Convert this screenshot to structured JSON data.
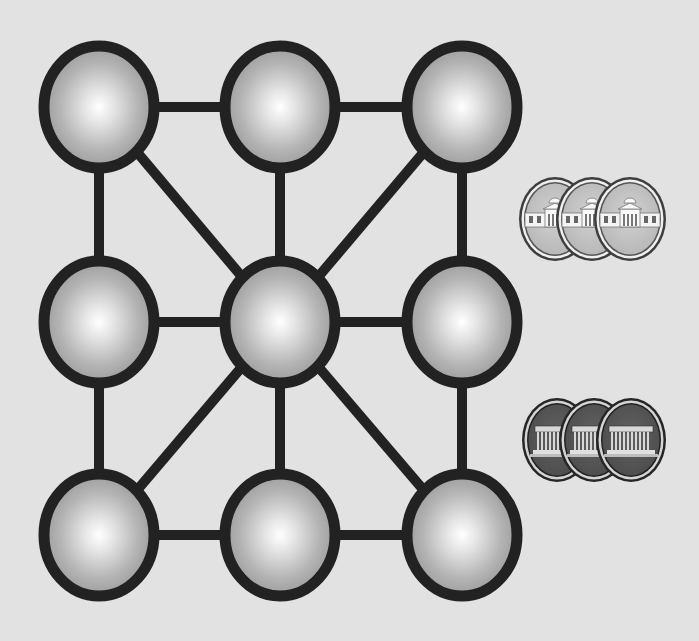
{
  "colors": {
    "background": "#e2e2e2",
    "edge": "#222222",
    "node_center": "#ffffff",
    "node_outer": "#9a9a9a",
    "silver_face": "#c8c8c8",
    "silver_rim": "#4a4a4a",
    "dark_face": "#5a5a5a",
    "dark_rim": "#2e2e2e"
  },
  "board": {
    "node_rx": 60,
    "node_ry": 66,
    "nodes": [
      {
        "id": "top-left",
        "cx": 99,
        "cy": 107
      },
      {
        "id": "top-center",
        "cx": 280,
        "cy": 107
      },
      {
        "id": "top-right",
        "cx": 462,
        "cy": 107
      },
      {
        "id": "middle-left",
        "cx": 99,
        "cy": 322
      },
      {
        "id": "center",
        "cx": 280,
        "cy": 322
      },
      {
        "id": "middle-right",
        "cx": 462,
        "cy": 322
      },
      {
        "id": "bottom-left",
        "cx": 99,
        "cy": 535
      },
      {
        "id": "bottom-center",
        "cx": 280,
        "cy": 535
      },
      {
        "id": "bottom-right",
        "cx": 462,
        "cy": 535
      }
    ],
    "edges": [
      [
        "top-left",
        "top-center"
      ],
      [
        "top-center",
        "top-right"
      ],
      [
        "middle-left",
        "center"
      ],
      [
        "center",
        "middle-right"
      ],
      [
        "bottom-left",
        "bottom-center"
      ],
      [
        "bottom-center",
        "bottom-right"
      ],
      [
        "top-left",
        "middle-left"
      ],
      [
        "middle-left",
        "bottom-left"
      ],
      [
        "top-center",
        "center"
      ],
      [
        "center",
        "bottom-center"
      ],
      [
        "top-right",
        "middle-right"
      ],
      [
        "middle-right",
        "bottom-right"
      ],
      [
        "top-left",
        "center"
      ],
      [
        "top-right",
        "center"
      ],
      [
        "center",
        "bottom-left"
      ],
      [
        "center",
        "bottom-right"
      ]
    ]
  },
  "pieces": {
    "silver_stack": {
      "type": "silver-coin",
      "emblem": "domed-building-icon",
      "count": 3,
      "coins": [
        {
          "cx": 555,
          "cy": 219
        },
        {
          "cx": 592,
          "cy": 219
        },
        {
          "cx": 630,
          "cy": 219
        }
      ],
      "rx": 36,
      "ry": 42
    },
    "dark_stack": {
      "type": "dark-coin",
      "emblem": "memorial-building-icon",
      "count": 3,
      "coins": [
        {
          "cx": 557,
          "cy": 440
        },
        {
          "cx": 594,
          "cy": 440
        },
        {
          "cx": 631,
          "cy": 440
        }
      ],
      "rx": 35,
      "ry": 42
    }
  }
}
